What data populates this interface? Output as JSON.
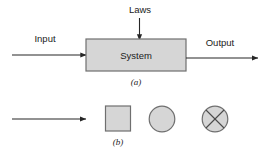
{
  "figure": {
    "background_color": "#ffffff",
    "line_color": "#262626",
    "shape_fill_color": "#d6d6d6",
    "shape_stroke_color": "#6f6f6f",
    "text_color": "#1b1b1b"
  },
  "part_a": {
    "caption": "(a)",
    "block_label": "System",
    "input_label": "Input",
    "output_label": "Output",
    "top_input_label": "Laws"
  },
  "part_b": {
    "caption": "(b)",
    "legend_shapes": [
      {
        "name": "arrow",
        "label": ""
      },
      {
        "name": "square",
        "label": ""
      },
      {
        "name": "circle",
        "label": ""
      },
      {
        "name": "crossed-circle",
        "label": ""
      }
    ]
  }
}
